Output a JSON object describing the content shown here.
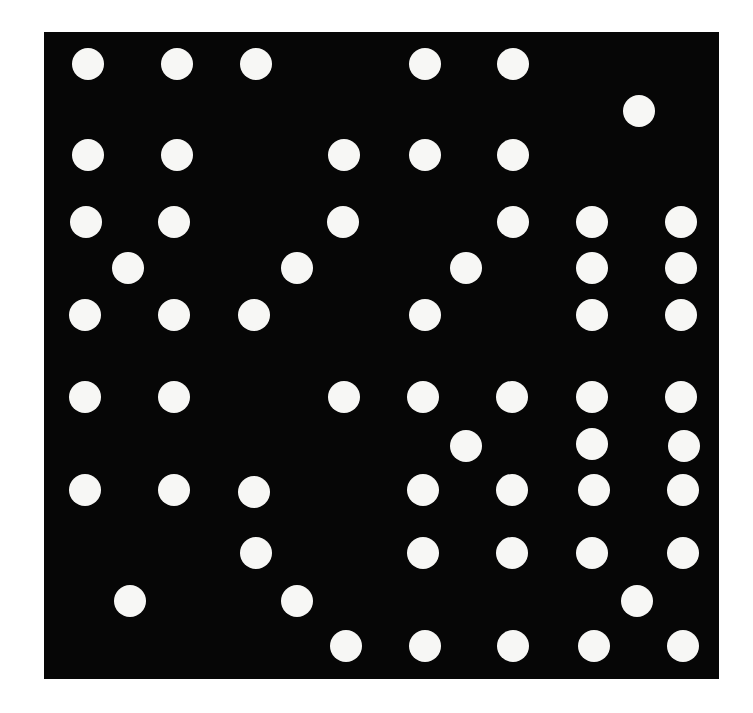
{
  "figure": {
    "background_color": "#ffffff",
    "board": {
      "color": "#060606",
      "x": 44,
      "y": 32,
      "width": 675,
      "height": 647
    },
    "dot": {
      "color": "#f7f7f5",
      "diameter": 32
    },
    "dots": [
      [
        88,
        64
      ],
      [
        177,
        64
      ],
      [
        256,
        64
      ],
      [
        425,
        64
      ],
      [
        513,
        64
      ],
      [
        639,
        111
      ],
      [
        88,
        155
      ],
      [
        177,
        155
      ],
      [
        344,
        155
      ],
      [
        425,
        155
      ],
      [
        513,
        155
      ],
      [
        86,
        222
      ],
      [
        174,
        222
      ],
      [
        343,
        222
      ],
      [
        513,
        222
      ],
      [
        592,
        222
      ],
      [
        681,
        222
      ],
      [
        128,
        268
      ],
      [
        297,
        268
      ],
      [
        466,
        268
      ],
      [
        592,
        268
      ],
      [
        681,
        268
      ],
      [
        85,
        315
      ],
      [
        174,
        315
      ],
      [
        254,
        315
      ],
      [
        425,
        315
      ],
      [
        592,
        315
      ],
      [
        681,
        315
      ],
      [
        85,
        397
      ],
      [
        174,
        397
      ],
      [
        344,
        397
      ],
      [
        423,
        397
      ],
      [
        512,
        397
      ],
      [
        592,
        397
      ],
      [
        681,
        397
      ],
      [
        466,
        446
      ],
      [
        592,
        444
      ],
      [
        684,
        446
      ],
      [
        85,
        490
      ],
      [
        174,
        490
      ],
      [
        254,
        492
      ],
      [
        423,
        490
      ],
      [
        512,
        490
      ],
      [
        594,
        490
      ],
      [
        683,
        490
      ],
      [
        256,
        553
      ],
      [
        423,
        553
      ],
      [
        512,
        553
      ],
      [
        592,
        553
      ],
      [
        683,
        553
      ],
      [
        130,
        601
      ],
      [
        297,
        601
      ],
      [
        637,
        601
      ],
      [
        346,
        646
      ],
      [
        425,
        646
      ],
      [
        513,
        646
      ],
      [
        594,
        646
      ],
      [
        683,
        646
      ]
    ]
  }
}
